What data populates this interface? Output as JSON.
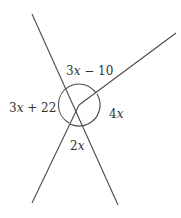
{
  "diagram": {
    "type": "angles-around-a-point",
    "center": {
      "x": 79,
      "y": 105
    },
    "rays": [
      {
        "name": "ray-upper-left",
        "x2": 32,
        "y2": 14
      },
      {
        "name": "ray-upper-right",
        "x2": 176,
        "y2": 33
      },
      {
        "name": "ray-lower-left",
        "x2": 32,
        "y2": 203
      },
      {
        "name": "ray-lower-right",
        "x2": 118,
        "y2": 205
      }
    ],
    "angles": [
      {
        "position": "top",
        "label_coef": "3",
        "label_var": "x",
        "label_rest": " − 10",
        "x": 66,
        "y": 75
      },
      {
        "position": "left",
        "label_coef": "3",
        "label_var": "x",
        "label_rest": " + 22",
        "x": 9,
        "y": 112
      },
      {
        "position": "right",
        "label_coef": "4",
        "label_var": "x",
        "label_rest": "",
        "x": 109,
        "y": 118
      },
      {
        "position": "bottom",
        "label_coef": "2",
        "label_var": "x",
        "label_rest": "",
        "x": 70,
        "y": 150
      }
    ],
    "line_color": "#4a4a4a",
    "text_color": "#333333"
  }
}
